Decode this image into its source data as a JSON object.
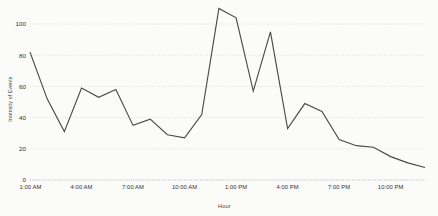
{
  "chart_data": {
    "type": "line",
    "title": "",
    "xlabel": "Hour",
    "ylabel": "Intensity of Events",
    "grid": true,
    "legend": false,
    "ylim": [
      0,
      112
    ],
    "yticks": [
      0,
      20,
      40,
      60,
      80,
      100
    ],
    "ytick_labels": [
      "0",
      "20",
      "40",
      "60",
      "80",
      "100"
    ],
    "xtick_labels": [
      "1:00 AM",
      "4:00 AM",
      "7:00 AM",
      "10:00 AM",
      "1:00 PM",
      "4:00 PM",
      "7:00 PM",
      "10:00 PM"
    ],
    "xtick_hours": [
      1,
      4,
      7,
      10,
      13,
      16,
      19,
      22
    ],
    "x": [
      1,
      2,
      3,
      4,
      5,
      6,
      7,
      8,
      9,
      10,
      11,
      12,
      13,
      14,
      15,
      16,
      17,
      18,
      19,
      20,
      21,
      22,
      23,
      24
    ],
    "x_labels": [
      "1:00 AM",
      "2:00 AM",
      "3:00 AM",
      "4:00 AM",
      "5:00 AM",
      "6:00 AM",
      "7:00 AM",
      "8:00 AM",
      "9:00 AM",
      "10:00 AM",
      "11:00 AM",
      "12:00 PM",
      "1:00 PM",
      "2:00 PM",
      "3:00 PM",
      "4:00 PM",
      "5:00 PM",
      "6:00 PM",
      "7:00 PM",
      "8:00 PM",
      "9:00 PM",
      "10:00 PM",
      "11:00 PM",
      "12:00 AM"
    ],
    "values": [
      82,
      52,
      31,
      59,
      53,
      58,
      35,
      39,
      29,
      27,
      42,
      110,
      104,
      57,
      95,
      33,
      49,
      44,
      26,
      22,
      21,
      15,
      11,
      8
    ],
    "series": [
      {
        "name": "Intensity of Events",
        "color": "#4a4a4a",
        "values": [
          82,
          52,
          31,
          59,
          53,
          58,
          35,
          39,
          29,
          27,
          42,
          110,
          104,
          57,
          95,
          33,
          49,
          44,
          26,
          22,
          21,
          15,
          11,
          8
        ]
      }
    ],
    "colors": {
      "line": "#4a4a4a",
      "grid": "#d9d9d6",
      "axis": "#b5b5b2",
      "background": "#fbfbfa",
      "text": "#2f2f2f"
    }
  }
}
